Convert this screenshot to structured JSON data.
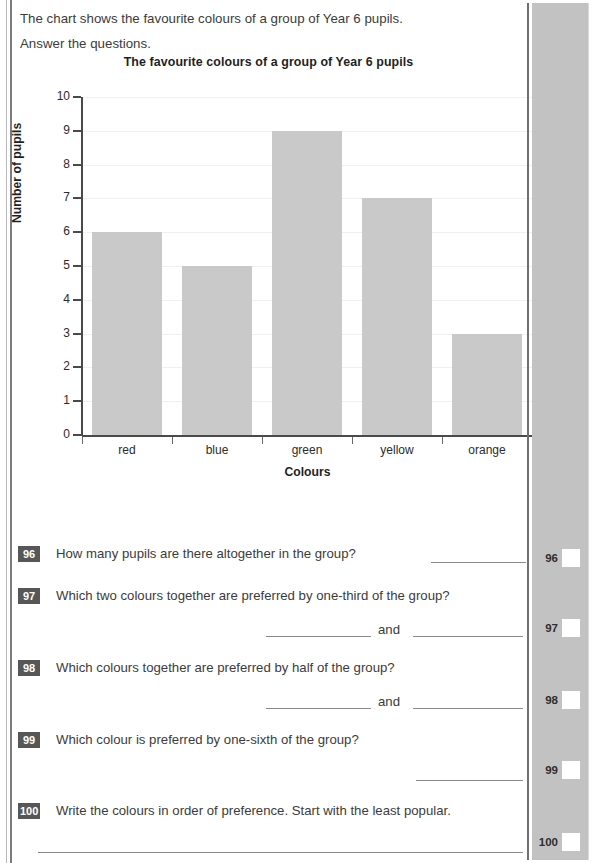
{
  "intro": {
    "line1": "The chart shows the favourite colours of a group of Year 6 pupils.",
    "line2": "Answer the questions."
  },
  "chart_data": {
    "type": "bar",
    "title": "The favourite colours of a group of Year 6 pupils",
    "xlabel": "Colours",
    "ylabel": "Number of pupils",
    "categories": [
      "red",
      "blue",
      "green",
      "yellow",
      "orange"
    ],
    "values": [
      6,
      5,
      9,
      7,
      3
    ],
    "ylim": [
      0,
      10
    ],
    "ytick_labels": [
      "0",
      "1",
      "2",
      "3",
      "4",
      "5",
      "6",
      "7",
      "8",
      "9",
      "10"
    ],
    "grid": true,
    "legend": "none",
    "bar_color": "#c9c9c9",
    "axis_color": "#4a4a4a"
  },
  "questions": [
    {
      "number": "96",
      "text": "How many pupils are there altogether in the group?",
      "answer_style": "single-inline"
    },
    {
      "number": "97",
      "text": "Which two colours together are preferred by one-third of the group?",
      "answer_style": "two-and",
      "connector": "and"
    },
    {
      "number": "98",
      "text": "Which colours together are preferred by half of the group?",
      "answer_style": "two-and",
      "connector": "and"
    },
    {
      "number": "99",
      "text": "Which colour is preferred by one-sixth of the group?",
      "answer_style": "single-right"
    },
    {
      "number": "100",
      "text": "Write the colours in order of preference. Start with the least popular.",
      "answer_style": "full-width"
    }
  ],
  "margin_marks": [
    {
      "number": "96"
    },
    {
      "number": "97"
    },
    {
      "number": "98"
    },
    {
      "number": "99"
    },
    {
      "number": "100"
    }
  ],
  "colors": {
    "band": "#c2c2c2",
    "badge": "#575757",
    "rule": "#8a8a8a"
  }
}
